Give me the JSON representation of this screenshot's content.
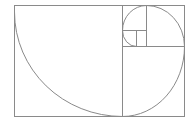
{
  "diagram": {
    "stroke_color": "#7a7a7a",
    "background": "#ffffff",
    "outer_rect": {
      "x": 14,
      "y": 5,
      "w": 170,
      "h": 111
    },
    "squares": [
      {
        "x": 14,
        "y": 5,
        "size": 108
      },
      {
        "x": 122,
        "y": 5,
        "size": 62
      },
      {
        "x": 147,
        "y": 46,
        "size": 37
      },
      {
        "x": 122,
        "y": 30,
        "size": 25
      },
      {
        "x": 122,
        "y": 5,
        "size": 0
      },
      {
        "x": 136,
        "y": 30,
        "size": 14
      }
    ]
  }
}
